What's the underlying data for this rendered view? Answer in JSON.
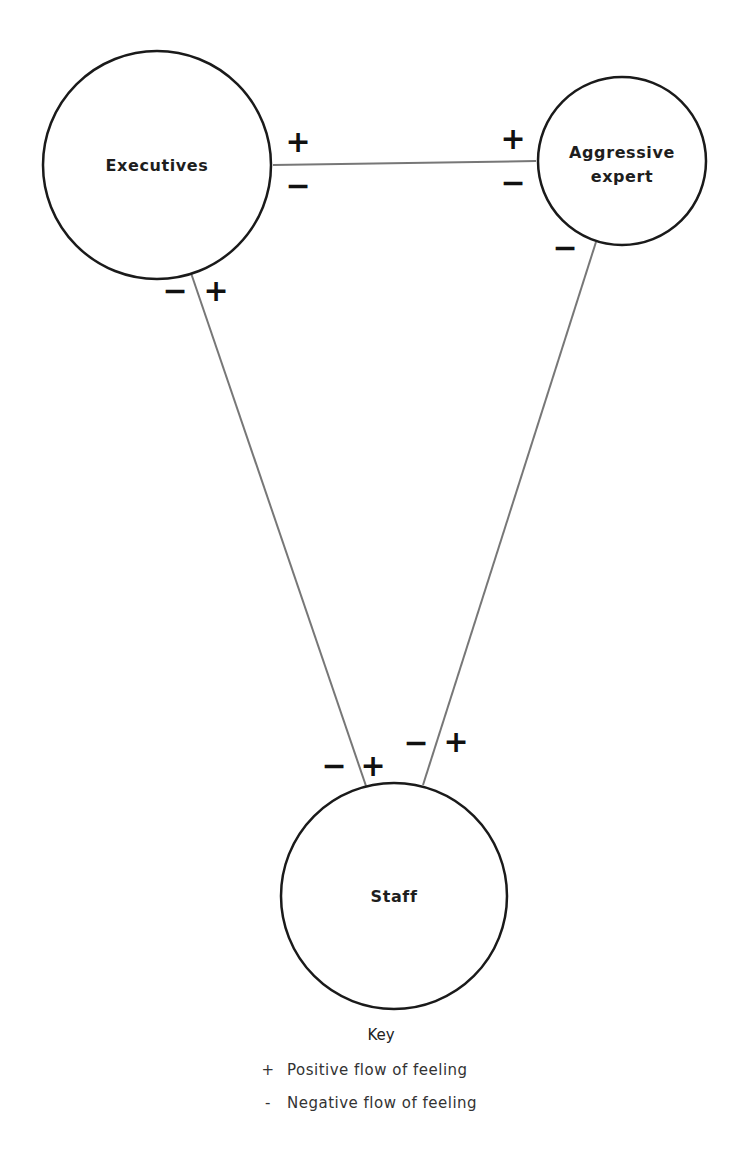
{
  "nodes": {
    "executives": {
      "label": "Executives"
    },
    "aggressive_expert": {
      "label_line1": "Aggressive",
      "label_line2": "expert"
    },
    "staff": {
      "label": "Staff"
    }
  },
  "signs": {
    "exec_to_expert_top_left": "+",
    "exec_to_expert_bottom_left": "−",
    "exec_to_expert_top_right": "+",
    "exec_to_expert_bottom_right": "−",
    "exec_to_staff_top_left": "−",
    "exec_to_staff_top_right": "+",
    "expert_to_staff_top": "−",
    "staff_left_line_left": "−",
    "staff_left_line_right": "+",
    "staff_right_line_left": "−",
    "staff_right_line_right": "+"
  },
  "key": {
    "title": "Key",
    "items": [
      {
        "symbol": "+",
        "label": "Positive flow of feeling"
      },
      {
        "symbol": "-",
        "label": "Negative flow of feeling"
      }
    ]
  },
  "colors": {
    "stroke": "#1a1a1a",
    "connector": "#666666"
  }
}
